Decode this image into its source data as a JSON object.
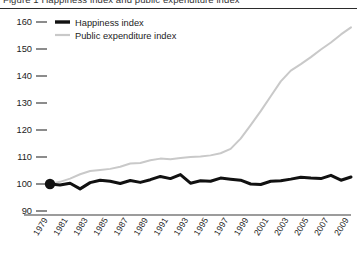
{
  "title": "Figure 1  Happiness index and public expenditure index",
  "legend": {
    "position": "top-left",
    "entries": [
      {
        "label": "Happiness index",
        "color": "#111111",
        "width": 3.0
      },
      {
        "label": "Public expenditure index",
        "color": "#c9c9c9",
        "width": 2.0
      }
    ]
  },
  "axes": {
    "y_ticks": [
      "160",
      "150",
      "140",
      "130",
      "120",
      "110",
      "100",
      "90"
    ],
    "x_ticks": [
      "1979",
      "1981",
      "1983",
      "1985",
      "1987",
      "1989",
      "1991",
      "1993",
      "1995",
      "1997",
      "1999",
      "2001",
      "2003",
      "2005",
      "2007",
      "2009"
    ]
  },
  "marker": {
    "name": "origin-dot",
    "year": 1979,
    "value": 100,
    "color": "#111111"
  },
  "chart_data": {
    "type": "line",
    "title": "Happiness index and public expenditure index",
    "xlabel": "",
    "ylabel": "",
    "xlim": [
      1978,
      2010
    ],
    "ylim": [
      90,
      160
    ],
    "grid": false,
    "legend_position": "top-left",
    "x": [
      1979,
      1980,
      1981,
      1982,
      1983,
      1984,
      1985,
      1986,
      1987,
      1988,
      1989,
      1990,
      1991,
      1992,
      1993,
      1994,
      1995,
      1996,
      1997,
      1998,
      1999,
      2000,
      2001,
      2002,
      2003,
      2004,
      2005,
      2006,
      2007,
      2008,
      2009
    ],
    "series": [
      {
        "name": "Happiness index",
        "color": "#111111",
        "values": [
          100.0,
          99.6,
          100.3,
          98.2,
          100.5,
          101.4,
          101.0,
          100.2,
          101.3,
          100.6,
          101.6,
          102.8,
          102.0,
          103.5,
          100.3,
          101.2,
          101.0,
          102.2,
          101.8,
          101.4,
          100.0,
          99.8,
          101.0,
          101.2,
          101.8,
          102.5,
          102.2,
          102.0,
          103.2,
          101.4,
          102.6
        ]
      },
      {
        "name": "Public expenditure index",
        "color": "#c9c9c9",
        "values": [
          100.0,
          100.8,
          102.0,
          103.6,
          104.8,
          105.2,
          105.6,
          106.4,
          107.6,
          107.8,
          108.8,
          109.4,
          109.2,
          109.6,
          110.0,
          110.2,
          110.6,
          111.4,
          113.0,
          116.8,
          121.8,
          127.0,
          132.5,
          138.0,
          142.0,
          144.4,
          147.0,
          149.8,
          152.4,
          155.4,
          158.0
        ]
      }
    ]
  }
}
